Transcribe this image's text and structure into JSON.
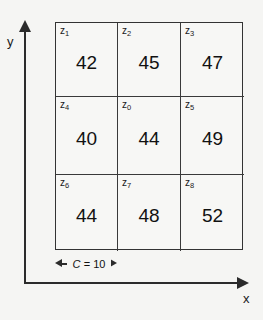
{
  "figure": {
    "background_color": "#f5f5f3",
    "line_color": "#2b2b2b"
  },
  "axes": {
    "y": {
      "label": "y",
      "arrow": "arrow-up-icon"
    },
    "x": {
      "label": "x",
      "arrow": "arrow-right-icon"
    }
  },
  "measure": {
    "symbol": "C",
    "equals": "=",
    "value": "10",
    "text": "C = 10",
    "left_arrow": "arrow-left-icon",
    "right_arrow": "arrow-right-icon"
  },
  "grid": {
    "rows": 3,
    "cols": 3,
    "cells": [
      {
        "key": "z",
        "sub": "1",
        "value": "42"
      },
      {
        "key": "z",
        "sub": "2",
        "value": "45"
      },
      {
        "key": "z",
        "sub": "3",
        "value": "47"
      },
      {
        "key": "z",
        "sub": "4",
        "value": "40"
      },
      {
        "key": "z",
        "sub": "0",
        "value": "44"
      },
      {
        "key": "z",
        "sub": "5",
        "value": "49"
      },
      {
        "key": "z",
        "sub": "6",
        "value": "44"
      },
      {
        "key": "z",
        "sub": "7",
        "value": "48"
      },
      {
        "key": "z",
        "sub": "8",
        "value": "52"
      }
    ]
  },
  "chart_data": {
    "type": "heatmap",
    "title": "",
    "xlabel": "x",
    "ylabel": "y",
    "grid": true,
    "legend": "none",
    "rows": 3,
    "cols": 3,
    "cell_size": 10,
    "cell_size_label": "C = 10",
    "labels": [
      [
        "z1",
        "z2",
        "z3"
      ],
      [
        "z4",
        "z0",
        "z5"
      ],
      [
        "z6",
        "z7",
        "z8"
      ]
    ],
    "values": [
      [
        42,
        45,
        47
      ],
      [
        40,
        44,
        49
      ],
      [
        44,
        48,
        52
      ]
    ],
    "annotations": [
      "C = 10"
    ]
  }
}
